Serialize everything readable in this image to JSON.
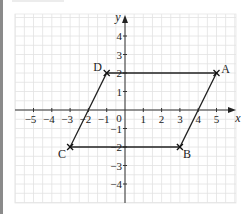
{
  "diagram": {
    "type": "coordinate-grid-parallelogram",
    "axes": {
      "x_label": "x",
      "y_label": "y",
      "origin_label": "0",
      "x_ticks": [
        "−5",
        "−4",
        "−3",
        "−2",
        "−1",
        "1",
        "2",
        "3",
        "4",
        "5"
      ],
      "y_ticks": [
        "4",
        "3",
        "2",
        "1",
        "−1",
        "−2",
        "−3",
        "−4"
      ],
      "x_range": [
        -6,
        6
      ],
      "y_range": [
        -5,
        5
      ]
    },
    "points": [
      {
        "name": "A",
        "x": 5,
        "y": 2
      },
      {
        "name": "B",
        "x": 3,
        "y": -2
      },
      {
        "name": "C",
        "x": -3,
        "y": -2
      },
      {
        "name": "D",
        "x": -1,
        "y": 2
      }
    ],
    "shape": "parallelogram ABCD",
    "colors": {
      "grid": "#dcdcdc",
      "axis": "#222222",
      "shape": "#222222"
    }
  }
}
